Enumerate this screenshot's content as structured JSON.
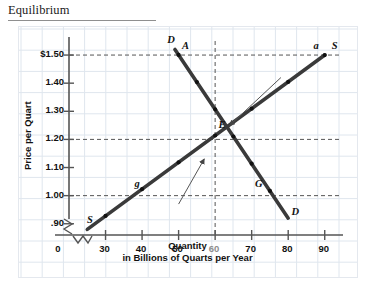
{
  "header": {
    "title": "Equilibrium"
  },
  "chart_data": {
    "type": "line",
    "title": "Equilibrium",
    "xlabel": "Quantity",
    "xlabel_sub": "in Billions of Quarts per Year",
    "ylabel": "Price per Quart",
    "xlim": [
      20,
      95
    ],
    "ylim": [
      0.86,
      1.55
    ],
    "axis_break_x": true,
    "axis_break_y": true,
    "grid": true,
    "legend": "none",
    "x_ticks": [
      {
        "value": 0,
        "label": "0",
        "muted": false
      },
      {
        "value": 30,
        "label": "30",
        "muted": false
      },
      {
        "value": 40,
        "label": "40",
        "muted": false
      },
      {
        "value": 50,
        "label": "50",
        "muted": false
      },
      {
        "value": 60,
        "label": "60",
        "muted": true
      },
      {
        "value": 70,
        "label": "70",
        "muted": false
      },
      {
        "value": 80,
        "label": "80",
        "muted": false
      },
      {
        "value": 90,
        "label": "90",
        "muted": false
      }
    ],
    "y_ticks": [
      {
        "value": 1.5,
        "label": "$1.50"
      },
      {
        "value": 1.4,
        "label": "1.40"
      },
      {
        "value": 1.3,
        "label": "1.30"
      },
      {
        "value": 1.2,
        "label": "1.20"
      },
      {
        "value": 1.1,
        "label": "1.10"
      },
      {
        "value": 1.0,
        "label": "1.00"
      },
      {
        "value": 0.9,
        "label": ".90"
      }
    ],
    "series": [
      {
        "name": "Supply",
        "label": "S",
        "kind": "supply",
        "x": [
          25,
          90
        ],
        "y": [
          0.88,
          1.5
        ],
        "points": [
          {
            "x": 30,
            "y": 0.93,
            "label": ""
          },
          {
            "x": 40,
            "y": 1.0,
            "label": "g"
          },
          {
            "x": 50,
            "y": 1.07,
            "label": ""
          },
          {
            "x": 60,
            "y": 1.2,
            "label": "E"
          },
          {
            "x": 70,
            "y": 1.3,
            "label": ""
          },
          {
            "x": 80,
            "y": 1.4,
            "label": ""
          },
          {
            "x": 90,
            "y": 1.5,
            "label": "a"
          }
        ]
      },
      {
        "name": "Demand",
        "label": "D",
        "kind": "demand",
        "x": [
          49,
          80
        ],
        "y": [
          1.52,
          0.92
        ],
        "points": [
          {
            "x": 50,
            "y": 1.5,
            "label": "A"
          },
          {
            "x": 55,
            "y": 1.38,
            "label": ""
          },
          {
            "x": 60,
            "y": 1.2,
            "label": "E"
          },
          {
            "x": 65,
            "y": 1.1,
            "label": ""
          },
          {
            "x": 70,
            "y": 1.0,
            "label": "G"
          },
          {
            "x": 75,
            "y": 0.96,
            "label": ""
          }
        ]
      }
    ],
    "equilibrium": {
      "x": 60,
      "y": 1.2,
      "label": "E"
    },
    "guide_lines": [
      {
        "type": "horizontal",
        "y": 1.5,
        "style": "dashed"
      },
      {
        "type": "horizontal",
        "y": 1.2,
        "style": "dashed"
      },
      {
        "type": "horizontal",
        "y": 1.0,
        "style": "dashed"
      },
      {
        "type": "vertical",
        "x": 60,
        "style": "dashed"
      }
    ],
    "annotations": [
      {
        "text": "",
        "kind": "arrow",
        "from": [
          78,
          1.42
        ],
        "to": [
          64,
          1.25
        ]
      },
      {
        "text": "",
        "kind": "arrow",
        "from": [
          50,
          0.97
        ],
        "to": [
          57,
          1.13
        ]
      }
    ],
    "curve_labels": [
      {
        "text": "S",
        "kind": "supply-start",
        "x": 26,
        "y": 0.905
      },
      {
        "text": "S",
        "kind": "supply-end",
        "x": 93,
        "y": 1.525
      },
      {
        "text": "D",
        "kind": "demand-start",
        "x": 48,
        "y": 1.545
      },
      {
        "text": "D",
        "kind": "demand-end",
        "x": 82,
        "y": 0.935
      },
      {
        "text": "A",
        "kind": "point",
        "x": 52,
        "y": 1.525
      },
      {
        "text": "a",
        "kind": "point",
        "x": 88,
        "y": 1.525
      },
      {
        "text": "E",
        "kind": "point",
        "x": 62,
        "y": 1.245
      },
      {
        "text": "g",
        "kind": "point",
        "x": 39,
        "y": 1.035
      },
      {
        "text": "G",
        "kind": "point",
        "x": 72,
        "y": 1.035
      }
    ]
  },
  "colors": {
    "curve": "#3a3a3a",
    "grid": "#dfe6ee",
    "axis": "#555555",
    "guide": "#555555",
    "text": "#111111",
    "muted_text": "#8d8d8d"
  }
}
